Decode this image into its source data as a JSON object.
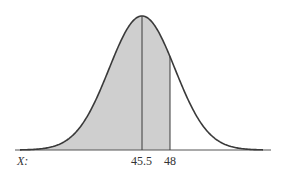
{
  "chart_data": {
    "type": "area",
    "title": "",
    "xlabel": "X:",
    "ylabel": "",
    "mean": 45.5,
    "sd_estimate": 2.94,
    "tick_labels": [
      "45.5",
      "48"
    ],
    "tick_values": [
      45.5,
      48
    ],
    "shaded_region": {
      "from": "-inf",
      "to": 48
    },
    "vertical_lines": [
      45.5,
      48
    ],
    "grid": false,
    "legend": null
  },
  "labels": {
    "x_variable": "X:",
    "mean_tick": "45.5",
    "value_tick": "48"
  },
  "colors": {
    "curve": "#3a3a3a",
    "shade": "#cfcfcf",
    "baseline": "#555555",
    "text": "#333333"
  }
}
